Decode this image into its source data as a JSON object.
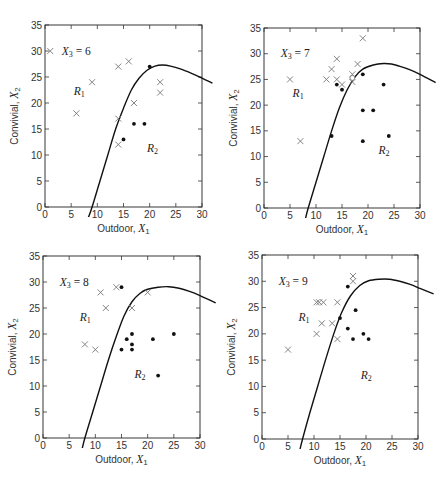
{
  "chart_data": [
    {
      "type": "scatter",
      "title": "X3 = 6",
      "xlabel": "Outdoor, X1",
      "ylabel": "Convivial, X2",
      "xlim": [
        0,
        30
      ],
      "ylim": [
        0,
        35
      ],
      "xticks": [
        0,
        5,
        10,
        15,
        20,
        25,
        30
      ],
      "yticks": [
        0,
        5,
        10,
        15,
        20,
        25,
        30,
        35
      ],
      "region_labels": [
        {
          "text": "R1",
          "x": 5.5,
          "y": 21.5
        },
        {
          "text": "R2",
          "x": 19.5,
          "y": 10.5
        }
      ],
      "series": [
        {
          "name": "Group 1 (x)",
          "marker": "cross",
          "points": [
            [
              1,
              30
            ],
            [
              6,
              18
            ],
            [
              9,
              24
            ],
            [
              14,
              27
            ],
            [
              16,
              28
            ],
            [
              17,
              20
            ],
            [
              14,
              17
            ],
            [
              14,
              12
            ],
            [
              22,
              24
            ],
            [
              22,
              22
            ]
          ]
        },
        {
          "name": "Group 2 (dot)",
          "marker": "dot",
          "points": [
            [
              20,
              27
            ],
            [
              15,
              13
            ],
            [
              17,
              16
            ],
            [
              19,
              16
            ]
          ]
        }
      ],
      "boundary_curve": [
        [
          8.3,
          -2
        ],
        [
          9,
          0
        ],
        [
          10.5,
          5
        ],
        [
          12,
          10
        ],
        [
          13.5,
          15
        ],
        [
          15,
          19
        ],
        [
          16.5,
          22.5
        ],
        [
          18,
          24.8
        ],
        [
          19.5,
          26.3
        ],
        [
          21,
          27.1
        ],
        [
          22.5,
          27.3
        ],
        [
          24,
          27.1
        ],
        [
          26,
          26.5
        ],
        [
          28,
          25.7
        ],
        [
          30,
          24.8
        ],
        [
          32,
          23.8
        ]
      ]
    },
    {
      "type": "scatter",
      "title": "X3 = 7",
      "xlabel": "Outdoor, X1",
      "ylabel": "Convivial, X2",
      "xlim": [
        0,
        30
      ],
      "ylim": [
        0,
        35
      ],
      "xticks": [
        0,
        5,
        10,
        15,
        20,
        25,
        30
      ],
      "yticks": [
        0,
        5,
        10,
        15,
        20,
        25,
        30,
        35
      ],
      "region_labels": [
        {
          "text": "R1",
          "x": 5.5,
          "y": 21.5
        },
        {
          "text": "R2",
          "x": 22,
          "y": 10.5
        }
      ],
      "series": [
        {
          "name": "Group 1 (x)",
          "marker": "cross",
          "points": [
            [
              5,
              25
            ],
            [
              7,
              13
            ],
            [
              12,
              25
            ],
            [
              13,
              27
            ],
            [
              14,
              29
            ],
            [
              14,
              25
            ],
            [
              15,
              24
            ],
            [
              17,
              26
            ],
            [
              17,
              24.5
            ],
            [
              18,
              28
            ],
            [
              19,
              33
            ]
          ]
        },
        {
          "name": "Group 2 (dot)",
          "marker": "dot",
          "points": [
            [
              14,
              24
            ],
            [
              15,
              23
            ],
            [
              13,
              14
            ],
            [
              19,
              26
            ],
            [
              19,
              19
            ],
            [
              21,
              19
            ],
            [
              23,
              24
            ],
            [
              19,
              13
            ],
            [
              24,
              14
            ]
          ]
        },
        {
          "name": "Misclassified (o)",
          "marker": "circle",
          "points": [
            [
              17,
              25.3
            ]
          ]
        }
      ],
      "boundary_curve": [
        [
          8,
          -2
        ],
        [
          8.5,
          0
        ],
        [
          10,
          5
        ],
        [
          11.5,
          10
        ],
        [
          13,
          15
        ],
        [
          14.5,
          19.5
        ],
        [
          16,
          23
        ],
        [
          17.5,
          25.5
        ],
        [
          19,
          27
        ],
        [
          21,
          27.8
        ],
        [
          23,
          28.1
        ],
        [
          24.5,
          28
        ],
        [
          26,
          27.6
        ],
        [
          28,
          26.9
        ],
        [
          30,
          26
        ],
        [
          33,
          24.4
        ]
      ]
    },
    {
      "type": "scatter",
      "title": "X3 = 8",
      "xlabel": "Outdoor, X1",
      "ylabel": "Convivial, X2",
      "xlim": [
        0,
        30
      ],
      "ylim": [
        0,
        35
      ],
      "xticks": [
        0,
        5,
        10,
        15,
        20,
        25,
        30
      ],
      "yticks": [
        0,
        5,
        10,
        15,
        20,
        25,
        30,
        35
      ],
      "region_labels": [
        {
          "text": "R1",
          "x": 7,
          "y": 22.5
        },
        {
          "text": "R2",
          "x": 17.5,
          "y": 11.5
        }
      ],
      "series": [
        {
          "name": "Group 1 (x)",
          "marker": "cross",
          "points": [
            [
              8,
              18
            ],
            [
              10,
              17
            ],
            [
              11,
              28
            ],
            [
              12,
              25
            ],
            [
              14,
              29
            ],
            [
              17,
              25
            ],
            [
              20,
              28
            ]
          ]
        },
        {
          "name": "Group 2 (dot)",
          "marker": "dot",
          "points": [
            [
              15,
              29
            ],
            [
              15,
              17
            ],
            [
              16,
              19
            ],
            [
              17,
              20
            ],
            [
              17,
              18
            ],
            [
              17,
              17
            ],
            [
              21,
              19
            ],
            [
              25,
              20
            ],
            [
              22,
              12
            ]
          ]
        }
      ],
      "boundary_curve": [
        [
          7.5,
          -2
        ],
        [
          8,
          0
        ],
        [
          9.5,
          5
        ],
        [
          11,
          10
        ],
        [
          12.5,
          15
        ],
        [
          14,
          19.5
        ],
        [
          15.5,
          23.5
        ],
        [
          17,
          26.2
        ],
        [
          18.5,
          27.8
        ],
        [
          20,
          28.6
        ],
        [
          22,
          29
        ],
        [
          24,
          29.1
        ],
        [
          26,
          28.8
        ],
        [
          28,
          28.2
        ],
        [
          30,
          27.4
        ],
        [
          33,
          26
        ]
      ]
    },
    {
      "type": "scatter",
      "title": "X3 = 9",
      "xlabel": "Outdoor, X1",
      "ylabel": "Convivial, X2",
      "xlim": [
        0,
        30
      ],
      "ylim": [
        0,
        35
      ],
      "xticks": [
        0,
        5,
        10,
        15,
        20,
        25,
        30
      ],
      "yticks": [
        0,
        5,
        10,
        15,
        20,
        25,
        30,
        35
      ],
      "region_labels": [
        {
          "text": "R1",
          "x": 7,
          "y": 22.5
        },
        {
          "text": "R2",
          "x": 19,
          "y": 11.5
        }
      ],
      "series": [
        {
          "name": "Group 1 (x)",
          "marker": "cross",
          "points": [
            [
              5,
              17
            ],
            [
              10.5,
              26
            ],
            [
              11,
              26
            ],
            [
              11.8,
              26
            ],
            [
              10.5,
              20
            ],
            [
              11.5,
              22
            ],
            [
              13.5,
              22
            ],
            [
              14.5,
              26
            ],
            [
              14.5,
              19
            ],
            [
              17.5,
              30
            ],
            [
              17.5,
              31
            ]
          ]
        },
        {
          "name": "Group 2 (dot)",
          "marker": "dot",
          "points": [
            [
              16.5,
              29
            ],
            [
              15,
              23
            ],
            [
              18,
              24.5
            ],
            [
              16.5,
              21
            ],
            [
              17.5,
              19
            ],
            [
              19.5,
              20
            ],
            [
              20.5,
              19
            ]
          ]
        }
      ],
      "boundary_curve": [
        [
          7.3,
          -2
        ],
        [
          7.8,
          0
        ],
        [
          9.2,
          5
        ],
        [
          10.7,
          10
        ],
        [
          12.2,
          15
        ],
        [
          13.8,
          20
        ],
        [
          15.3,
          24
        ],
        [
          17,
          27.2
        ],
        [
          18.8,
          29.2
        ],
        [
          20.5,
          30.1
        ],
        [
          22.5,
          30.4
        ],
        [
          24.5,
          30.4
        ],
        [
          26.5,
          30
        ],
        [
          28.5,
          29.4
        ],
        [
          30.5,
          28.6
        ],
        [
          33,
          27.6
        ]
      ]
    }
  ],
  "panels": [
    {
      "title_var": "X",
      "title_sub": "3",
      "title_eq": " = 6",
      "xlabel_text": "Outdoor, ",
      "xlabel_var": "X",
      "xlabel_sub": "1",
      "ylabel_text": "Convivial, ",
      "ylabel_var": "X",
      "ylabel_sub": "2",
      "r1_var": "R",
      "r1_sub": "1",
      "r2_var": "R",
      "r2_sub": "2"
    },
    {
      "title_var": "X",
      "title_sub": "3",
      "title_eq": " = 7",
      "xlabel_text": "Outdoor, ",
      "xlabel_var": "X",
      "xlabel_sub": "1",
      "ylabel_text": "Convivial, ",
      "ylabel_var": "X",
      "ylabel_sub": "2",
      "r1_var": "R",
      "r1_sub": "1",
      "r2_var": "R",
      "r2_sub": "2"
    },
    {
      "title_var": "X",
      "title_sub": "3",
      "title_eq": " = 8",
      "xlabel_text": "Outdoor, ",
      "xlabel_var": "X",
      "xlabel_sub": "1",
      "ylabel_text": "Convivial, ",
      "ylabel_var": "X",
      "ylabel_sub": "2",
      "r1_var": "R",
      "r1_sub": "1",
      "r2_var": "R",
      "r2_sub": "2"
    },
    {
      "title_var": "X",
      "title_sub": "3",
      "title_eq": " = 9",
      "xlabel_text": "Outdoor, ",
      "xlabel_var": "X",
      "xlabel_sub": "1",
      "ylabel_text": "Convivial, ",
      "ylabel_var": "X",
      "ylabel_sub": "2",
      "r1_var": "R",
      "r1_sub": "1",
      "r2_var": "R",
      "r2_sub": "2"
    }
  ],
  "colors": {
    "cross": "#777777",
    "dot": "#111111",
    "curve": "#111111",
    "axis": "#222222"
  }
}
